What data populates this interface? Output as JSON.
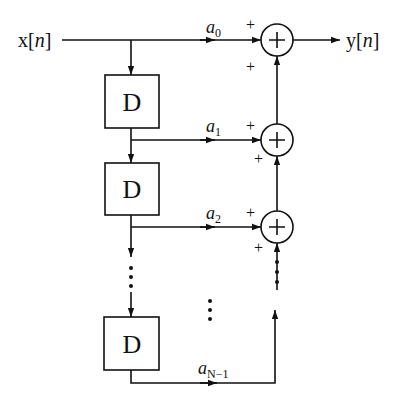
{
  "diagram": {
    "type": "FIR filter direct form (tapped delay line)",
    "input_label": "x[n]",
    "output_label": "y[n]",
    "delay_label": "D",
    "coefficients": [
      {
        "base": "a",
        "sub": "0"
      },
      {
        "base": "a",
        "sub": "1"
      },
      {
        "base": "a",
        "sub": "2"
      },
      {
        "base": "a",
        "sub": "N−1"
      }
    ],
    "adder_symbol": "+",
    "sign_label": "+",
    "continuation": "⋮",
    "colors": {
      "stroke": "#111111",
      "background": "#ffffff"
    }
  }
}
